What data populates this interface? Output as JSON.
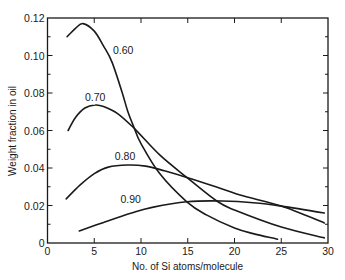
{
  "chart_data": {
    "type": "line",
    "title": "",
    "xlabel": "No. of Si atoms/molecule",
    "ylabel": "Weight fraction in oil",
    "xlim": [
      0,
      30
    ],
    "ylim": [
      0,
      0.12
    ],
    "xticks": [
      0,
      5,
      10,
      15,
      20,
      25,
      30
    ],
    "xtick_labels": [
      "0",
      "5",
      "10",
      "15",
      "20",
      "25",
      "30"
    ],
    "yticks": [
      0,
      0.02,
      0.04,
      0.06,
      0.08,
      0.1,
      0.12
    ],
    "ytick_labels": [
      "0",
      "0.02",
      "0.04",
      "0.06",
      "0.08",
      "0.10",
      "0.12"
    ],
    "grid": false,
    "legend": "inline curve labels",
    "series": [
      {
        "name": "0.60",
        "label_pos": [
          7.0,
          0.101
        ],
        "x": [
          2.1,
          3.0,
          3.8,
          5.0,
          6.0,
          6.9,
          8.0,
          8.6,
          9.3,
          10.0,
          12.0,
          14.9,
          17.0,
          20.0,
          22.0,
          24.6
        ],
        "y": [
          0.11,
          0.1145,
          0.117,
          0.113,
          0.105,
          0.0965,
          0.08,
          0.07,
          0.061,
          0.053,
          0.037,
          0.022,
          0.015,
          0.008,
          0.005,
          0.002
        ]
      },
      {
        "name": "0.70",
        "label_pos": [
          4.0,
          0.0755
        ],
        "x": [
          2.2,
          3.0,
          4.0,
          5.1,
          6.0,
          7.5,
          9.3,
          12.0,
          14.9,
          18.1,
          20.0,
          25.0,
          29.6
        ],
        "y": [
          0.06,
          0.067,
          0.072,
          0.0736,
          0.0728,
          0.069,
          0.061,
          0.047,
          0.035,
          0.0224,
          0.0176,
          0.0085,
          0.0027
        ]
      },
      {
        "name": "0.80",
        "label_pos": [
          7.2,
          0.0445
        ],
        "x": [
          2.0,
          3.5,
          5.0,
          6.5,
          8.6,
          10.5,
          12.5,
          14.9,
          18.0,
          21.0,
          25.0,
          29.6
        ],
        "y": [
          0.0235,
          0.031,
          0.037,
          0.0405,
          0.0416,
          0.041,
          0.0385,
          0.035,
          0.03,
          0.025,
          0.0197,
          0.0107
        ]
      },
      {
        "name": "0.90",
        "label_pos": [
          7.8,
          0.0215
        ],
        "x": [
          3.4,
          6.0,
          9.0,
          11.2,
          14.9,
          18.7,
          22.0,
          25.0,
          29.6
        ],
        "y": [
          0.0064,
          0.011,
          0.016,
          0.019,
          0.022,
          0.0224,
          0.0215,
          0.0197,
          0.016
        ]
      }
    ]
  }
}
